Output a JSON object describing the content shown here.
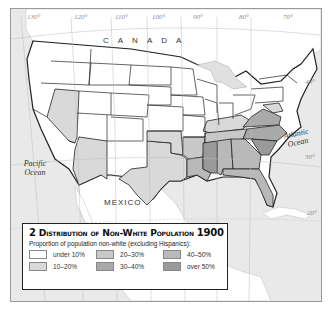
{
  "map": {
    "title_number": "2",
    "title": "Distribution of Non-White Population",
    "title_year": "1900",
    "labels": {
      "canada": "CANADA",
      "mexico": "MEXICO",
      "pacific": "Pacific Ocean",
      "pacific_line1": "Pacific",
      "pacific_line2": "Ocean",
      "atlantic_line1": "Atlantic",
      "atlantic_line2": "Ocean"
    },
    "graticule": {
      "longitudes": [
        "130°",
        "120°",
        "110°",
        "100°",
        "90°",
        "80°",
        "70°"
      ],
      "latitudes": [
        "40°",
        "30°",
        "20°"
      ]
    },
    "colors": {
      "under_10": "#ffffff",
      "10_20": "#d9d9d9",
      "20_30": "#c8c8c8",
      "30_40": "#a9a9a9",
      "40_50": "#b9b9b9",
      "over_50": "#9a9a9a",
      "sea": "#e9e9e9",
      "foreign_land": "#ffffff",
      "state_border": "#222222"
    }
  },
  "legend": {
    "subtitle": "Proportion of population non-white (excluding Hispanics):",
    "items": [
      {
        "label": "under 10%",
        "color": "#ffffff"
      },
      {
        "label": "20–30%",
        "color": "#c8c8c8"
      },
      {
        "label": "40–50%",
        "color": "#b9b9b9"
      },
      {
        "label": "10–20%",
        "color": "#d9d9d9"
      },
      {
        "label": "30–40%",
        "color": "#a9a9a9"
      },
      {
        "label": "over 50%",
        "color": "#9a9a9a"
      }
    ]
  },
  "states_by_category": {
    "under 10%": [
      "Washington",
      "Oregon",
      "Idaho",
      "Montana",
      "Wyoming",
      "Utah",
      "Colorado",
      "New Mexico",
      "North Dakota",
      "South Dakota",
      "Nebraska",
      "Kansas",
      "Minnesota",
      "Iowa",
      "Wisconsin",
      "Michigan",
      "Illinois",
      "Indiana",
      "Ohio",
      "Pennsylvania",
      "New York",
      "New England",
      "Missouri",
      "West Virginia",
      "California"
    ],
    "10–20%": [
      "Nevada",
      "Arizona",
      "Kentucky",
      "Oklahoma/Indian Territory",
      "Texas",
      "Maryland",
      "Delaware"
    ],
    "20–30%": [
      "Arkansas",
      "Tennessee"
    ],
    "30–40%": [
      "Virginia",
      "North Carolina"
    ],
    "40–50%": [
      "Florida",
      "Georgia",
      "Alabama",
      "Louisiana"
    ],
    "over 50%": [
      "Mississippi",
      "South Carolina"
    ]
  }
}
